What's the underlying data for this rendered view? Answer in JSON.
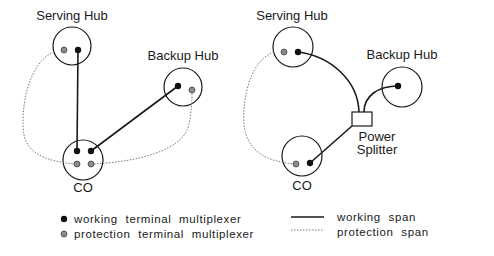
{
  "left_diagram": {
    "serving_hub_label": "Serving Hub",
    "backup_hub_label": "Backup Hub",
    "co_label": "CO"
  },
  "right_diagram": {
    "serving_hub_label": "Serving Hub",
    "backup_hub_label": "Backup Hub",
    "co_label": "CO",
    "splitter_label_line1": "Power",
    "splitter_label_line2": "Splitter"
  },
  "legend": {
    "working_tm": "working terminal multiplexer",
    "protection_tm": "protection terminal multiplexer",
    "working_span": "working span",
    "protection_span": "protection span"
  },
  "colors": {
    "working": "#111111",
    "protection": "#8a8a8a"
  }
}
